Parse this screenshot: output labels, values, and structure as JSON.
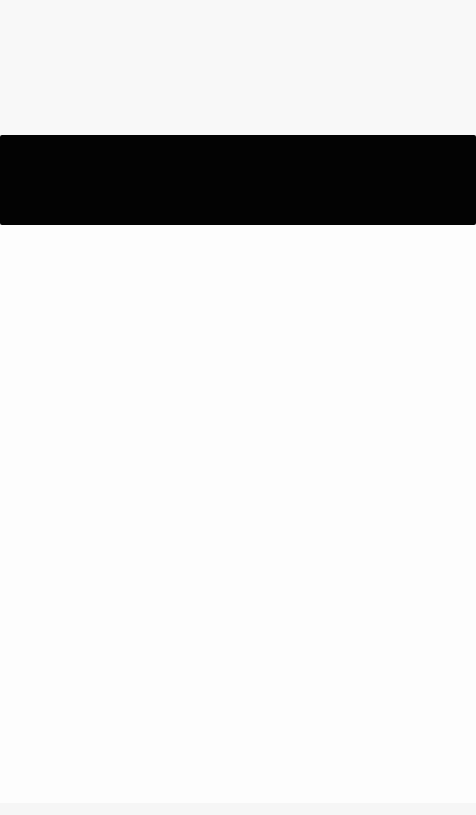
{
  "theme": {
    "background": "#fdfdfd",
    "banner_color": "#030303"
  },
  "header": {
    "text": ""
  },
  "banner": {
    "text": ""
  },
  "content": {
    "text": ""
  }
}
